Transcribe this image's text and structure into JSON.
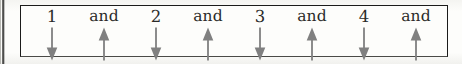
{
  "diagram": {
    "kind": "eighth-note-counting-chart",
    "box_border_color": "#1b1b1a",
    "background_color": "#fdfdfb",
    "text_color": "#2a2a28",
    "arrow_color": "#808080",
    "beats": [
      {
        "label": "1",
        "type": "number",
        "arrow": "arrow-down",
        "direction": "down"
      },
      {
        "label": "and",
        "type": "word",
        "arrow": "arrow-up",
        "direction": "up"
      },
      {
        "label": "2",
        "type": "number",
        "arrow": "arrow-down",
        "direction": "down"
      },
      {
        "label": "and",
        "type": "word",
        "arrow": "arrow-up",
        "direction": "up"
      },
      {
        "label": "3",
        "type": "number",
        "arrow": "arrow-down",
        "direction": "down"
      },
      {
        "label": "and",
        "type": "word",
        "arrow": "arrow-up",
        "direction": "up"
      },
      {
        "label": "4",
        "type": "number",
        "arrow": "arrow-down",
        "direction": "down"
      },
      {
        "label": "and",
        "type": "word",
        "arrow": "arrow-up",
        "direction": "up"
      }
    ]
  }
}
